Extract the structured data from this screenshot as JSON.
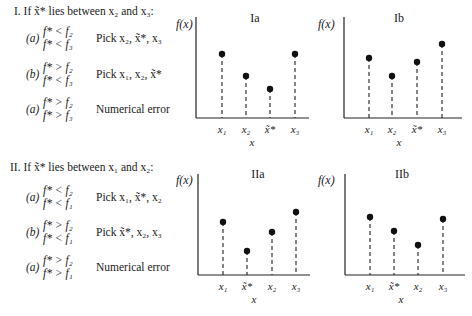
{
  "section_I": {
    "heading": "I. If x̃* lies between x₂ and x₃:",
    "cases": [
      {
        "label": "(a)",
        "cond1": "f* < f₂",
        "cond2": "f* < f₃",
        "action": "Pick x₂, x̃*, x₃"
      },
      {
        "label": "(b)",
        "cond1": "f* > f₂",
        "cond2": "f* < f₃",
        "action": "Pick x₁, x₂, x̃*"
      },
      {
        "label": "(a)",
        "cond1": "f* > f₂",
        "cond2": "f* > f₃",
        "action": "Numerical error"
      }
    ]
  },
  "section_II": {
    "heading": "II. If x̃* lies between x₁ and x₂:",
    "cases": [
      {
        "label": "(a)",
        "cond1": "f* < f₂",
        "cond2": "f* < f₁",
        "action": "Pick x₁, x̃*, x₂"
      },
      {
        "label": "(b)",
        "cond1": "f* > f₂",
        "cond2": "f* < f₁",
        "action": "Pick x̃*, x₂, x₃"
      },
      {
        "label": "(a)",
        "cond1": "f* > f₂",
        "cond2": "f* > f₁",
        "action": "Numerical error"
      }
    ]
  },
  "plots": [
    {
      "id": "Ia",
      "title": "Ia",
      "ylabel": "f(x)",
      "xlabel": "x",
      "ticks": [
        "x₁",
        "x₂",
        "x̃*",
        "x₃"
      ],
      "heights": [
        64,
        42,
        29,
        64
      ]
    },
    {
      "id": "Ib",
      "title": "Ib",
      "ylabel": "f(x)",
      "xlabel": "x",
      "ticks": [
        "x₁",
        "x₂",
        "x̃*",
        "x₃"
      ],
      "heights": [
        60,
        42,
        56,
        74
      ]
    },
    {
      "id": "IIa",
      "title": "IIa",
      "ylabel": "f(x)",
      "xlabel": "x",
      "ticks": [
        "x₁",
        "x̃*",
        "x₂",
        "x₃"
      ],
      "heights": [
        53,
        24,
        43,
        63
      ]
    },
    {
      "id": "IIb",
      "title": "IIb",
      "ylabel": "f(x)",
      "xlabel": "x",
      "ticks": [
        "x₁",
        "x̃*",
        "x₂",
        "x₃"
      ],
      "heights": [
        58,
        44,
        30,
        56
      ]
    }
  ]
}
